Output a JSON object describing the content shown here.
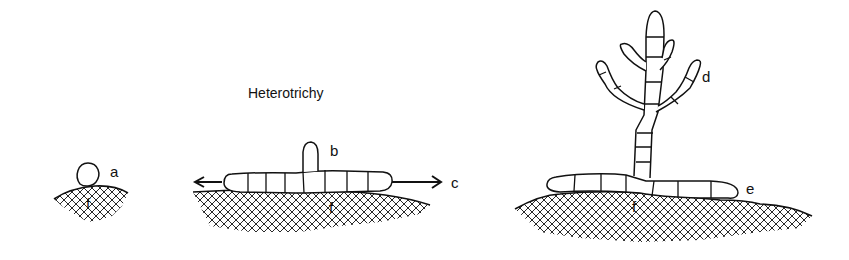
{
  "diagram": {
    "title": "Heterotrichy",
    "stages": [
      {
        "id": "stage-1",
        "description": "single spore settled on substratum",
        "labels": [
          "a",
          "f"
        ]
      },
      {
        "id": "stage-2",
        "description": "prostrate filament with erect initial and spreading growth",
        "labels": [
          "b",
          "c",
          "f"
        ]
      },
      {
        "id": "stage-3",
        "description": "mature heterotrichous thallus with erect branched system and prostrate system",
        "labels": [
          "d",
          "e",
          "f"
        ]
      }
    ],
    "labels": {
      "a": "a",
      "b": "b",
      "c": "c",
      "d": "d",
      "e": "e",
      "f1": "f",
      "f2": "f",
      "f3": "f"
    },
    "colors": {
      "ink": "#111111",
      "background": "#ffffff"
    }
  }
}
